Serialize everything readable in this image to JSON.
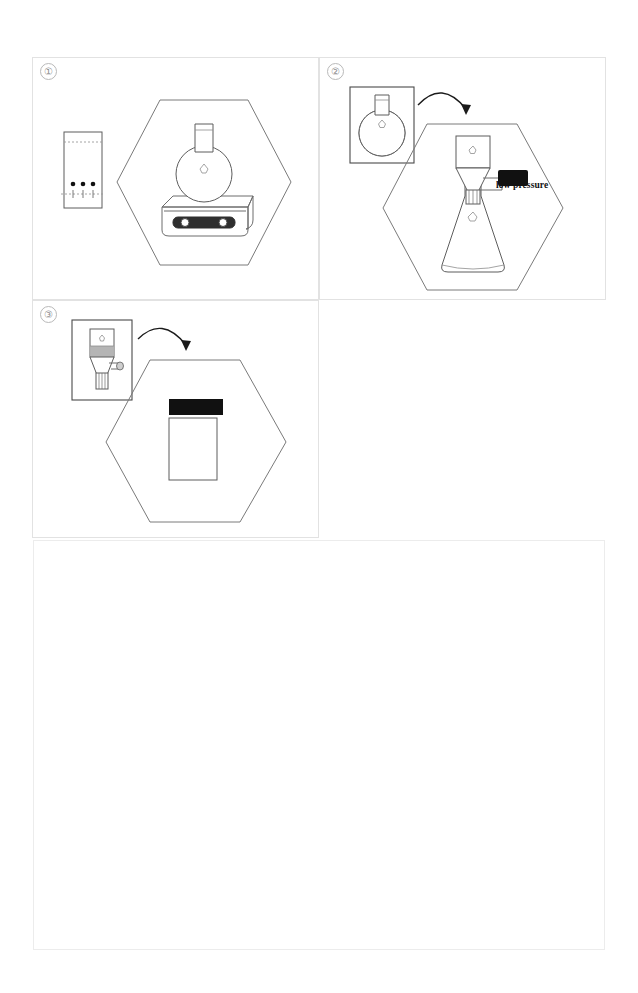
{
  "figure": {
    "type": "laboratory-procedure-illustration",
    "panel_count": 3,
    "background_color": "#ffffff",
    "line_color": "#6d6d6d",
    "accent_color": "#111111"
  },
  "panels": [
    {
      "number": "①",
      "name": "reaction-setup",
      "inset": {
        "name": "tlc-plate",
        "spot_count": 3,
        "has_solvent_front": true,
        "has_baseline": true,
        "baseline_marks": 3
      },
      "hexagon_scene": {
        "name": "round-bottom-flask-on-hotplate-stirrer",
        "apparatus": [
          "round-bottom-flask",
          "hotplate-stirrer"
        ],
        "knob_count": 2,
        "flask_filled": false
      },
      "arrow": false,
      "label": ""
    },
    {
      "number": "②",
      "name": "vacuum-filtration",
      "inset": {
        "name": "filled-round-bottom-flask",
        "flask_filled": true,
        "fill_shade": "#9a9a9a"
      },
      "hexagon_scene": {
        "name": "buchner-funnel-on-filter-flask",
        "apparatus": [
          "buchner-funnel",
          "filter-flask",
          "vacuum-connector"
        ],
        "flask_filled": false
      },
      "arrow": true,
      "label": "low pressure"
    },
    {
      "number": "③",
      "name": "product-collection",
      "inset": {
        "name": "buchner-funnel-with-filter-cake",
        "cake_shade": "#b0b0b0",
        "has_side_arm": true
      },
      "hexagon_scene": {
        "name": "sample-vial",
        "apparatus": [
          "sample-vial"
        ],
        "cap_color": "#111111",
        "body_color": "#ffffff"
      },
      "arrow": true,
      "label": ""
    }
  ],
  "notes_box": {
    "name": "caption-area",
    "content": "",
    "border_color": "#ececec"
  }
}
